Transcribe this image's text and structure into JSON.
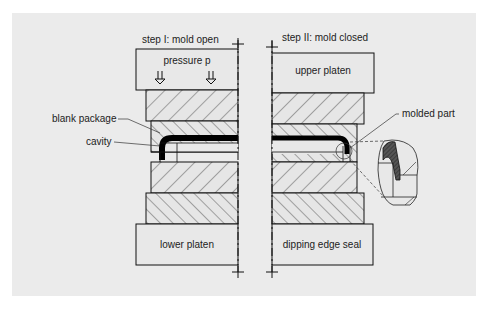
{
  "diagram": {
    "background_color": "#ebebeb",
    "line_color": "#111111",
    "hatch_color": "#333333",
    "fill_color": "#e8e8e8",
    "left": {
      "title": "step I: mold open",
      "upper_box_label": "pressure p",
      "lower_box_label": "lower platen",
      "arrow_icons": [
        "double-down-arrow",
        "double-down-arrow"
      ]
    },
    "right": {
      "title": "step II: mold closed",
      "upper_box_label": "upper platen",
      "lower_box_label": "dipping edge seal"
    },
    "callouts": {
      "blank_package": "blank package",
      "cavity": "cavity",
      "molded_part": "molded part"
    }
  }
}
